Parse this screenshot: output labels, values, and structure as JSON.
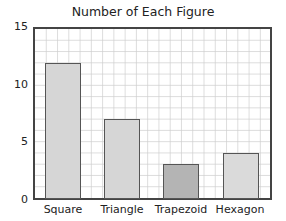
{
  "chart_data": {
    "type": "bar",
    "title": "Number of Each Figure",
    "categories": [
      "Square",
      "Triangle",
      "Trapezoid",
      "Hexagon"
    ],
    "values": [
      12,
      7,
      3,
      4
    ],
    "xlabel": "",
    "ylabel": "",
    "ylim": [
      0,
      15
    ],
    "yticks": [
      "0",
      "5",
      "10",
      "15"
    ],
    "grid": true,
    "legend": null,
    "bar_colors": [
      "#d6d6d6",
      "#d6d6d6",
      "#b4b4b4",
      "#dadada"
    ]
  }
}
